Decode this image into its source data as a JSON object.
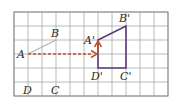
{
  "diagram": {
    "grid": {
      "x0": 14,
      "y0": 12,
      "cols": 11,
      "rows": 6,
      "cell": 14,
      "color": "#a8a8a8",
      "border_color": "#8a8a8a"
    },
    "original_shape": {
      "color": "#b0b0b0",
      "points": {
        "A": [
          28,
          54
        ],
        "B": [
          56,
          40
        ]
      },
      "labels": [
        {
          "text": "A",
          "x": 17,
          "y": 58
        },
        {
          "text": "B",
          "x": 51,
          "y": 37
        },
        {
          "text": "D",
          "x": 23,
          "y": 94
        },
        {
          "text": "C",
          "x": 51,
          "y": 94
        }
      ]
    },
    "image_shape": {
      "color": "#5a3a7a",
      "points": {
        "A'": [
          98,
          40
        ],
        "B'": [
          126,
          26
        ],
        "C'": [
          126,
          68
        ],
        "D'": [
          98,
          68
        ]
      },
      "labels": [
        {
          "text": "A'",
          "x": 84,
          "y": 44
        },
        {
          "text": "B'",
          "x": 119,
          "y": 22
        },
        {
          "text": "D'",
          "x": 91,
          "y": 80
        },
        {
          "text": "C'",
          "x": 120,
          "y": 80
        }
      ]
    },
    "translation_arrows": {
      "color": "#c0502a",
      "horizontal": {
        "from": [
          28,
          54
        ],
        "to": [
          97,
          54
        ],
        "style": "dashed"
      },
      "vertical": {
        "from": [
          98,
          54
        ],
        "to": [
          98,
          41
        ],
        "style": "solid"
      }
    }
  }
}
